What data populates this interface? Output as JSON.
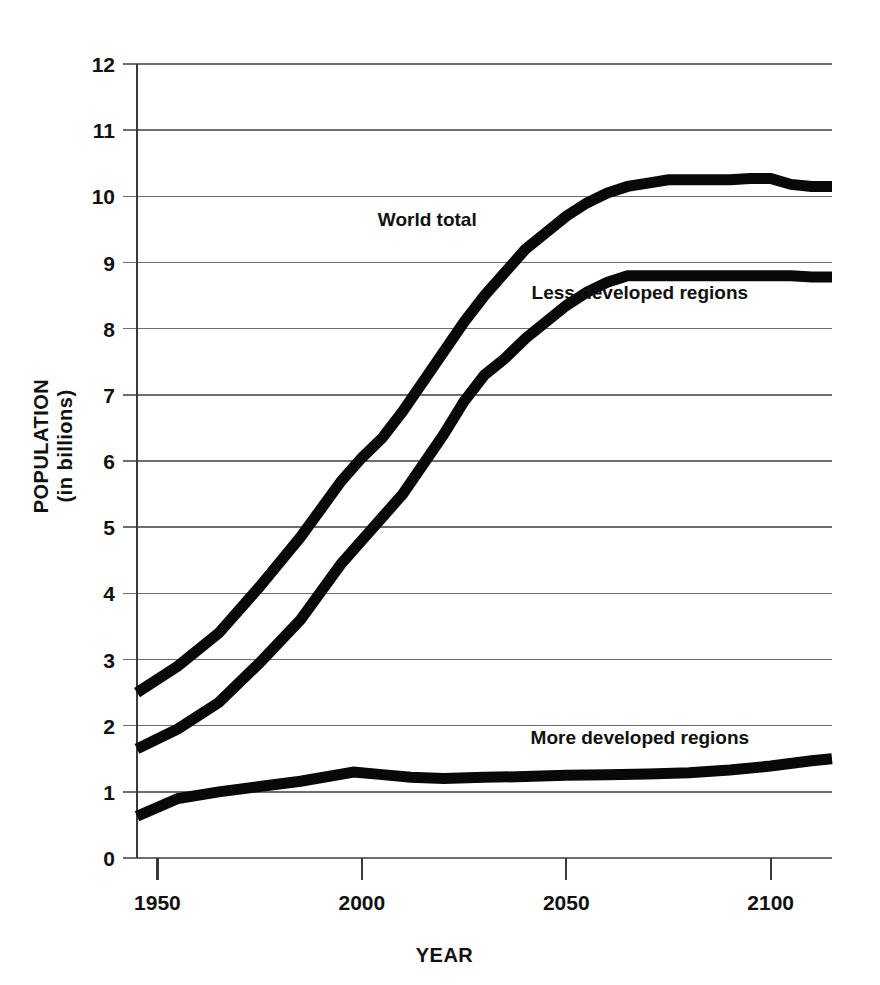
{
  "chart_data": {
    "type": "line",
    "title": "",
    "xlabel": "YEAR",
    "ylabel": "POPULATION (in billions)",
    "ylabel_line1": "POPULATION",
    "ylabel_line2": "(in billions)",
    "xlim": [
      1945,
      2115
    ],
    "ylim": [
      0,
      12
    ],
    "x_ticks": [
      1950,
      2000,
      2050,
      2100
    ],
    "x_tick_labels": [
      "1950",
      "2000",
      "2050",
      "2100"
    ],
    "y_ticks": [
      0,
      1,
      2,
      3,
      4,
      5,
      6,
      7,
      8,
      9,
      10,
      11,
      12
    ],
    "y_tick_labels": [
      "0",
      "1",
      "2",
      "3",
      "4",
      "5",
      "6",
      "7",
      "8",
      "9",
      "10",
      "11",
      "12"
    ],
    "grid": true,
    "grid_axis": "y",
    "legend": "inline-annotations",
    "line_color": "#080808",
    "series": [
      {
        "name": "World total",
        "label": "World total",
        "label_x": 2016,
        "label_y": 9.55,
        "x": [
          1945,
          1955,
          1965,
          1975,
          1985,
          1995,
          2000,
          2005,
          2010,
          2015,
          2020,
          2025,
          2030,
          2035,
          2040,
          2045,
          2050,
          2055,
          2060,
          2065,
          2070,
          2075,
          2080,
          2085,
          2090,
          2095,
          2100,
          2105,
          2110,
          2115
        ],
        "y": [
          2.5,
          2.9,
          3.4,
          4.1,
          4.85,
          5.7,
          6.05,
          6.35,
          6.75,
          7.2,
          7.65,
          8.1,
          8.5,
          8.85,
          9.2,
          9.45,
          9.7,
          9.9,
          10.05,
          10.15,
          10.2,
          10.25,
          10.25,
          10.25,
          10.25,
          10.27,
          10.27,
          10.18,
          10.15,
          10.15
        ]
      },
      {
        "name": "Less developed regions",
        "label": "Less developed regions",
        "label_x": 2068,
        "label_y": 8.45,
        "x": [
          1945,
          1955,
          1965,
          1975,
          1985,
          1995,
          2000,
          2005,
          2010,
          2015,
          2020,
          2025,
          2030,
          2035,
          2040,
          2045,
          2050,
          2055,
          2060,
          2065,
          2070,
          2075,
          2080,
          2085,
          2090,
          2095,
          2100,
          2105,
          2110,
          2115
        ],
        "y": [
          1.65,
          1.95,
          2.35,
          2.95,
          3.6,
          4.45,
          4.8,
          5.15,
          5.5,
          5.95,
          6.4,
          6.9,
          7.3,
          7.55,
          7.85,
          8.1,
          8.35,
          8.55,
          8.7,
          8.8,
          8.8,
          8.8,
          8.8,
          8.8,
          8.8,
          8.8,
          8.8,
          8.8,
          8.78,
          8.78
        ]
      },
      {
        "name": "More developed regions",
        "label": "More developed regions",
        "label_x": 2068,
        "label_y": 1.72,
        "x": [
          1945,
          1955,
          1965,
          1975,
          1985,
          1998,
          2005,
          2012,
          2020,
          2030,
          2040,
          2050,
          2060,
          2070,
          2080,
          2090,
          2100,
          2110,
          2115
        ],
        "y": [
          0.63,
          0.9,
          1.0,
          1.08,
          1.16,
          1.3,
          1.26,
          1.22,
          1.2,
          1.22,
          1.23,
          1.25,
          1.26,
          1.27,
          1.29,
          1.33,
          1.39,
          1.47,
          1.5
        ]
      }
    ]
  }
}
